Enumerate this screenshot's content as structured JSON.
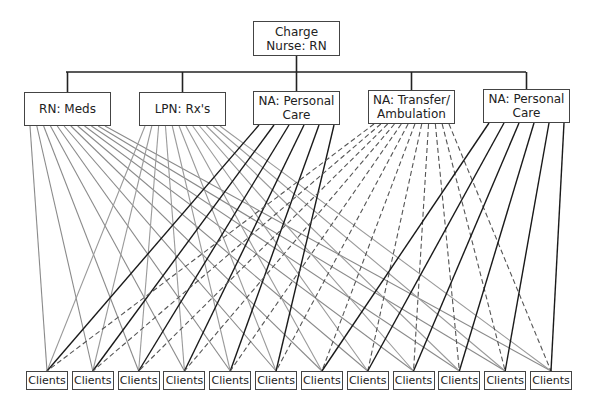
{
  "diagram": {
    "root": {
      "label": "Charge Nurse: RN",
      "box": [
        253,
        21,
        87,
        35
      ]
    },
    "bus": {
      "y": 72,
      "x1": 66,
      "x2": 526,
      "color": "#222222"
    },
    "roles": [
      {
        "id": "rn_meds",
        "label": "RN: Meds",
        "box": [
          24,
          92,
          87,
          34
        ],
        "line_style": "solid",
        "line_color": "#8a8a8a",
        "targets": [
          0,
          1,
          2,
          3,
          4,
          5,
          6,
          7,
          8,
          9,
          10,
          11
        ]
      },
      {
        "id": "lpn_rx",
        "label": "LPN: Rx's",
        "box": [
          139,
          92,
          87,
          34
        ],
        "line_style": "solid",
        "line_color": "#9a9a9a",
        "targets": [
          0,
          1,
          2,
          3,
          4,
          5,
          6,
          7,
          8,
          9,
          10,
          11
        ]
      },
      {
        "id": "na_personal_1",
        "label": "NA: Personal Care",
        "box": [
          253,
          91,
          87,
          34
        ],
        "line_style": "solid",
        "line_color": "#1a1a1a",
        "targets": [
          0,
          1,
          2,
          3,
          4,
          5
        ]
      },
      {
        "id": "na_transfer",
        "label": "NA: Transfer/ Ambulation",
        "box": [
          368,
          90,
          87,
          34
        ],
        "line_style": "dashed",
        "line_color": "#555555",
        "targets": [
          0,
          1,
          2,
          3,
          4,
          5,
          6,
          7,
          8,
          9,
          10,
          11
        ]
      },
      {
        "id": "na_personal_2",
        "label": "NA: Personal Care",
        "box": [
          483,
          89,
          87,
          34
        ],
        "line_style": "solid",
        "line_color": "#1a1a1a",
        "targets": [
          6,
          7,
          8,
          9,
          10,
          11
        ]
      }
    ],
    "clients": [
      {
        "label": "Clients"
      },
      {
        "label": "Clients"
      },
      {
        "label": "Clients"
      },
      {
        "label": "Clients"
      },
      {
        "label": "Clients"
      },
      {
        "label": "Clients"
      },
      {
        "label": "Clients"
      },
      {
        "label": "Clients"
      },
      {
        "label": "Clients"
      },
      {
        "label": "Clients"
      },
      {
        "label": "Clients"
      },
      {
        "label": "Clients"
      }
    ],
    "client_row": {
      "y": 371,
      "x_start": 26,
      "x_end": 530,
      "width": 42,
      "height": 19
    }
  }
}
